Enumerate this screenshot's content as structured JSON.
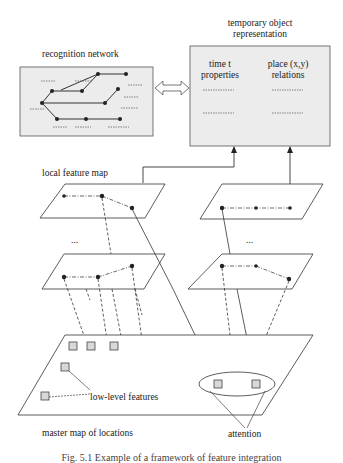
{
  "labels": {
    "recognition_network": "recognition network",
    "temporary_object_line1": "temporary object",
    "temporary_object_line2": "representation",
    "time_t": "time t",
    "properties": "properties",
    "place_xy": "place (x,y)",
    "relations": "relations",
    "local_feature_map": "local feature map",
    "ellipsis_left": "...",
    "ellipsis_right": "...",
    "low_level_features": "low-level features",
    "master_map": "master map of locations",
    "attention": "attention"
  },
  "caption": "Fig. 5.1  Example of a framework of feature integration",
  "colors": {
    "box_fill": "#ececec",
    "line": "#333333",
    "feature_square": "#d8d8d8"
  }
}
